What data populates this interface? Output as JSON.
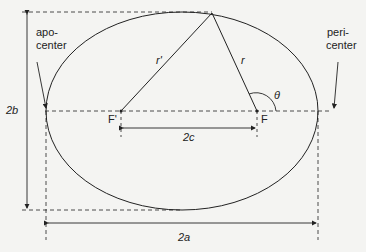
{
  "diagram": {
    "type": "ellipse-orbit-geometry",
    "labels": {
      "apocenter_line1": "apo-",
      "apocenter_line2": "center",
      "pericenter_line1": "peri-",
      "pericenter_line2": "center",
      "semi_minor_full": "2b",
      "semi_major_full": "2a",
      "focal_distance": "2c",
      "focus_empty": "F'",
      "focus_primary": "F",
      "radius_primary": "r",
      "radius_secondary": "r'",
      "angle": "θ"
    },
    "colors": {
      "stroke": "#222222",
      "background": "#f4f4f2"
    }
  }
}
